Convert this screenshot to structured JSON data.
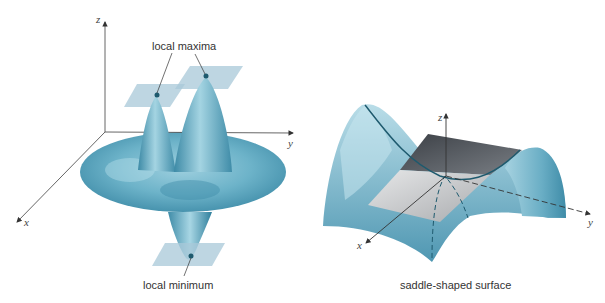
{
  "left_figure": {
    "title": "local extrema surface",
    "axes": {
      "z": "z",
      "y": "y",
      "x": "x"
    },
    "annotations": {
      "maxima": "local maxima",
      "minimum": "local minimum"
    }
  },
  "right_figure": {
    "axes": {
      "z": "z",
      "y": "y",
      "x": "x"
    },
    "caption": "saddle-shaped surface"
  },
  "colors": {
    "surface": "#5aa5c0",
    "surface_light": "#a9d6e3",
    "surface_dark": "#2f7f9c",
    "tangent_plane": "#a8c8d8",
    "saddle_plane_dark": "#555a60",
    "saddle_plane_light": "#c6c8ca",
    "point": "#1e5a6e",
    "axis": "#555555"
  }
}
